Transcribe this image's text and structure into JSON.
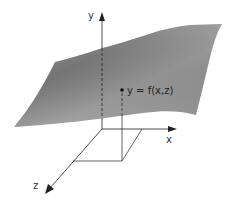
{
  "figure": {
    "type": "3d-surface-diagram",
    "axes": {
      "y_label": "y",
      "x_label": "x",
      "z_label": "z"
    },
    "point_label": "y = f(x,z)",
    "surface_color": "#8c8c8c",
    "axis_color": "#222222"
  }
}
